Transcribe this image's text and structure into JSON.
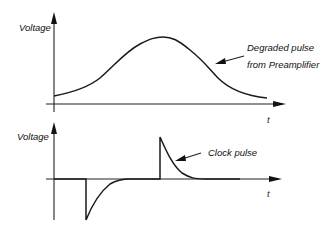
{
  "diagram": {
    "top_panel": {
      "y_label": "Voltage",
      "x_label": "t",
      "annotation_line1": "Degraded pulse",
      "annotation_line2": "from Preamplifier",
      "shape": "broad bell-shaped pulse rising from baseline, peaking mid-axis, decaying back"
    },
    "bottom_panel": {
      "y_label": "Voltage",
      "x_label": "t",
      "annotation": "Clock pulse",
      "shape": "sharp negative spike with exponential recovery, followed by sharp positive spike with exponential decay"
    }
  },
  "colors": {
    "background": "#ffffff",
    "ink": "#1a1a1a"
  }
}
